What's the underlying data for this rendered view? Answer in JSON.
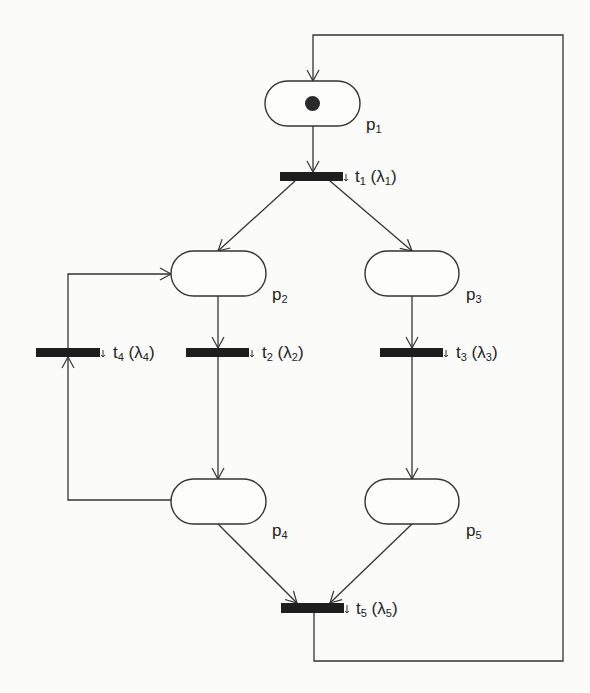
{
  "diagram": {
    "type": "stochastic-petri-net",
    "stroke_color": "#333333",
    "transition_color": "#1e1e1e",
    "background": "#fbfbf9",
    "places": [
      {
        "id": "p1",
        "name": "p",
        "sub": "1",
        "tokens": 1,
        "x": 265,
        "y": 81,
        "w": 95,
        "h": 45,
        "label_x": 366,
        "label_y": 116
      },
      {
        "id": "p2",
        "name": "p",
        "sub": "2",
        "tokens": 0,
        "x": 171,
        "y": 251,
        "w": 95,
        "h": 45,
        "label_x": 272,
        "label_y": 286
      },
      {
        "id": "p3",
        "name": "p",
        "sub": "3",
        "tokens": 0,
        "x": 365,
        "y": 251,
        "w": 94,
        "h": 45,
        "label_x": 466,
        "label_y": 286
      },
      {
        "id": "p4",
        "name": "p",
        "sub": "4",
        "tokens": 0,
        "x": 171,
        "y": 479,
        "w": 95,
        "h": 45,
        "label_x": 272,
        "label_y": 522
      },
      {
        "id": "p5",
        "name": "p",
        "sub": "5",
        "tokens": 0,
        "x": 365,
        "y": 479,
        "w": 94,
        "h": 45,
        "label_x": 466,
        "label_y": 522
      }
    ],
    "transitions": [
      {
        "id": "t1",
        "name": "t",
        "sub": "1",
        "rate": "λ",
        "rate_sub": "1",
        "x": 280,
        "y": 172,
        "w": 63,
        "h": 9,
        "label_x": 355,
        "label_y": 168
      },
      {
        "id": "t2",
        "name": "t",
        "sub": "2",
        "rate": "λ",
        "rate_sub": "2",
        "x": 186,
        "y": 348,
        "w": 63,
        "h": 9,
        "label_x": 262,
        "label_y": 344
      },
      {
        "id": "t3",
        "name": "t",
        "sub": "3",
        "rate": "λ",
        "rate_sub": "3",
        "x": 380,
        "y": 348,
        "w": 63,
        "h": 9,
        "label_x": 456,
        "label_y": 344
      },
      {
        "id": "t4",
        "name": "t",
        "sub": "4",
        "rate": "λ",
        "rate_sub": "4",
        "x": 36,
        "y": 348,
        "w": 64,
        "h": 9,
        "label_x": 113,
        "label_y": 344
      },
      {
        "id": "t5",
        "name": "t",
        "sub": "5",
        "rate": "λ",
        "rate_sub": "5",
        "x": 281,
        "y": 603,
        "w": 63,
        "h": 10,
        "label_x": 356,
        "label_y": 600
      }
    ],
    "arcs": [
      {
        "from": "t5",
        "to": "p1",
        "points": [
          [
            314,
            613
          ],
          [
            314,
            661
          ],
          [
            563,
            661
          ],
          [
            563,
            35
          ],
          [
            313,
            35
          ],
          [
            313,
            81
          ]
        ]
      },
      {
        "from": "p1",
        "to": "t1",
        "points": [
          [
            313,
            126
          ],
          [
            313,
            172
          ]
        ]
      },
      {
        "from": "t1",
        "to": "p2",
        "points": [
          [
            295,
            181
          ],
          [
            218,
            251
          ]
        ]
      },
      {
        "from": "t1",
        "to": "p3",
        "points": [
          [
            330,
            181
          ],
          [
            412,
            251
          ]
        ]
      },
      {
        "from": "p2",
        "to": "t2",
        "points": [
          [
            218,
            296
          ],
          [
            218,
            348
          ]
        ]
      },
      {
        "from": "t2",
        "to": "p4",
        "points": [
          [
            218,
            357
          ],
          [
            218,
            479
          ]
        ]
      },
      {
        "from": "p3",
        "to": "t3",
        "points": [
          [
            412,
            296
          ],
          [
            412,
            348
          ]
        ]
      },
      {
        "from": "t3",
        "to": "p5",
        "points": [
          [
            412,
            357
          ],
          [
            412,
            479
          ]
        ]
      },
      {
        "from": "p4",
        "to": "t4",
        "points": [
          [
            171,
            500
          ],
          [
            68,
            500
          ],
          [
            68,
            357
          ]
        ]
      },
      {
        "from": "t4",
        "to": "p2",
        "points": [
          [
            68,
            348
          ],
          [
            68,
            274
          ],
          [
            171,
            274
          ]
        ]
      },
      {
        "from": "p4",
        "to": "t5",
        "points": [
          [
            218,
            524
          ],
          [
            297,
            603
          ]
        ]
      },
      {
        "from": "p5",
        "to": "t5",
        "points": [
          [
            412,
            524
          ],
          [
            330,
            603
          ]
        ]
      }
    ]
  }
}
